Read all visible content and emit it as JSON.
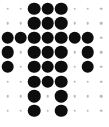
{
  "canvas": {
    "width": 109,
    "height": 127,
    "background_color": "#ffffff",
    "title": "Dot Matrix Glyph"
  },
  "grid": {
    "columns": 8,
    "rows": 8,
    "x_start": 7.5,
    "y_start": 8.5,
    "x_step": 13.4,
    "y_step": 14.6
  },
  "dot_styles": {
    "large": {
      "diameter": 12.6,
      "color": "#0d0d0d",
      "label": "filled-large-dot"
    },
    "small": {
      "diameter": 2.6,
      "color": "#b9b9b9",
      "label": "faint-small-dot"
    }
  },
  "matrix": [
    [
      "small",
      "small",
      "large",
      "large",
      "large",
      "small",
      "small",
      "small"
    ],
    [
      "small",
      "small",
      "large",
      "large",
      "large",
      "small",
      "small",
      "small"
    ],
    [
      "large",
      "large",
      "large",
      "large",
      "large",
      "large",
      "large",
      "small"
    ],
    [
      "large",
      "small",
      "large",
      "large",
      "large",
      "small",
      "large",
      "small"
    ],
    [
      "large",
      "small",
      "large",
      "large",
      "large",
      "small",
      "large",
      "small"
    ],
    [
      "small",
      "small",
      "large",
      "large",
      "large",
      "small",
      "small",
      "small"
    ],
    [
      "small",
      "small",
      "large",
      "small",
      "large",
      "small",
      "small",
      "small"
    ],
    [
      "small",
      "small",
      "large",
      "small",
      "large",
      "small",
      "small",
      "small"
    ]
  ]
}
